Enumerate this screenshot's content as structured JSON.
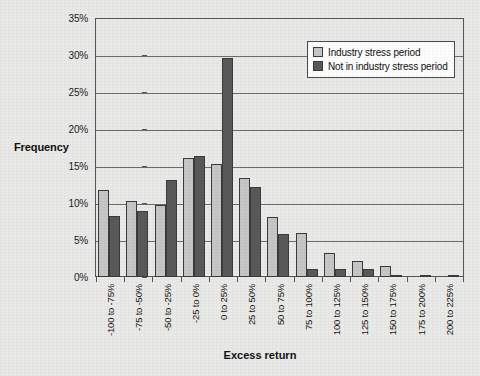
{
  "chart_data": {
    "type": "bar",
    "title": "",
    "subtitle": "",
    "xlabel": "Excess return",
    "ylabel": "Frequency",
    "ylim": [
      0,
      35
    ],
    "ytick_values": [
      0,
      5,
      10,
      15,
      20,
      25,
      30,
      35
    ],
    "ytick_labels": [
      "0%",
      "5%",
      "10%",
      "15%",
      "20%",
      "25%",
      "30%",
      "35%"
    ],
    "grid": true,
    "legend_position": "top-right",
    "categories": [
      "-100 to -75%",
      "-75 to -50%",
      "-50 to -25%",
      "-25 to 0%",
      "0 to 25%",
      "25 to 50%",
      "50 to 75%",
      "75 to 100%",
      "100 to 125%",
      "125 to 150%",
      "150 to 175%",
      "175 to 200%",
      "200 to 225%"
    ],
    "series": [
      {
        "name": "Industry stress period",
        "color": "#c6c6c6",
        "values": [
          11.8,
          10.3,
          9.8,
          16.2,
          15.3,
          13.4,
          8.2,
          6.0,
          3.3,
          2.2,
          1.5,
          0.0,
          0.0
        ]
      },
      {
        "name": "Not in industry stress period",
        "color": "#595959",
        "values": [
          8.3,
          9.0,
          13.2,
          16.4,
          29.7,
          12.2,
          5.8,
          1.1,
          1.1,
          1.1,
          0.15,
          0.3,
          0.3
        ]
      }
    ]
  }
}
